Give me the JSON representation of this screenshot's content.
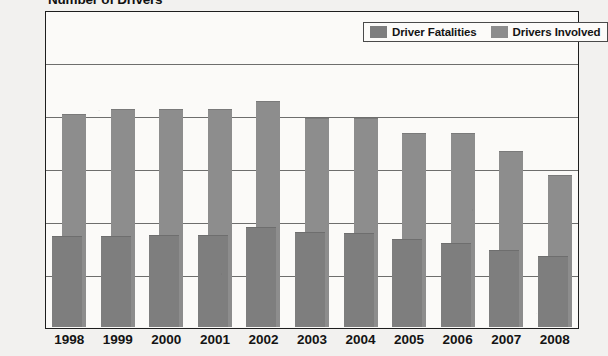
{
  "chart_data": {
    "type": "bar",
    "title": "Number of Drivers",
    "subtitle": "",
    "xlabel": "",
    "ylabel": "",
    "categories": [
      "1998",
      "1999",
      "2000",
      "2001",
      "2002",
      "2003",
      "2004",
      "2005",
      "2006",
      "2007",
      "2008"
    ],
    "series": [
      {
        "name": "Driver Fatalities",
        "color": "#7e7e7e",
        "values": [
          3400,
          3380,
          3450,
          3450,
          3750,
          3530,
          3500,
          3270,
          3150,
          2850,
          2650
        ]
      },
      {
        "name": "Drivers Involved",
        "color": "#8d8d8d",
        "values": [
          8000,
          8200,
          8200,
          8180,
          8500,
          7850,
          7850,
          7300,
          7280,
          6600,
          5700
        ]
      }
    ],
    "ylim": [
      0,
      10000
    ],
    "yticks": [
      0,
      2000,
      4000,
      6000,
      8000,
      10000
    ],
    "ytick_labels": [
      "0",
      "2000",
      "4000",
      "6000",
      "8000",
      "10000"
    ],
    "grid": true,
    "grid_axis": "y",
    "legend_position": "top-right",
    "bar_style": "overlapped",
    "background": "#fbfaf8",
    "axis_color": "#1e1e1e"
  },
  "legend": {
    "items": [
      {
        "label": "Driver Fatalities",
        "swatch": "legend-swatch-fatalities"
      },
      {
        "label": "Drivers Involved",
        "swatch": "legend-swatch-involved"
      }
    ]
  }
}
